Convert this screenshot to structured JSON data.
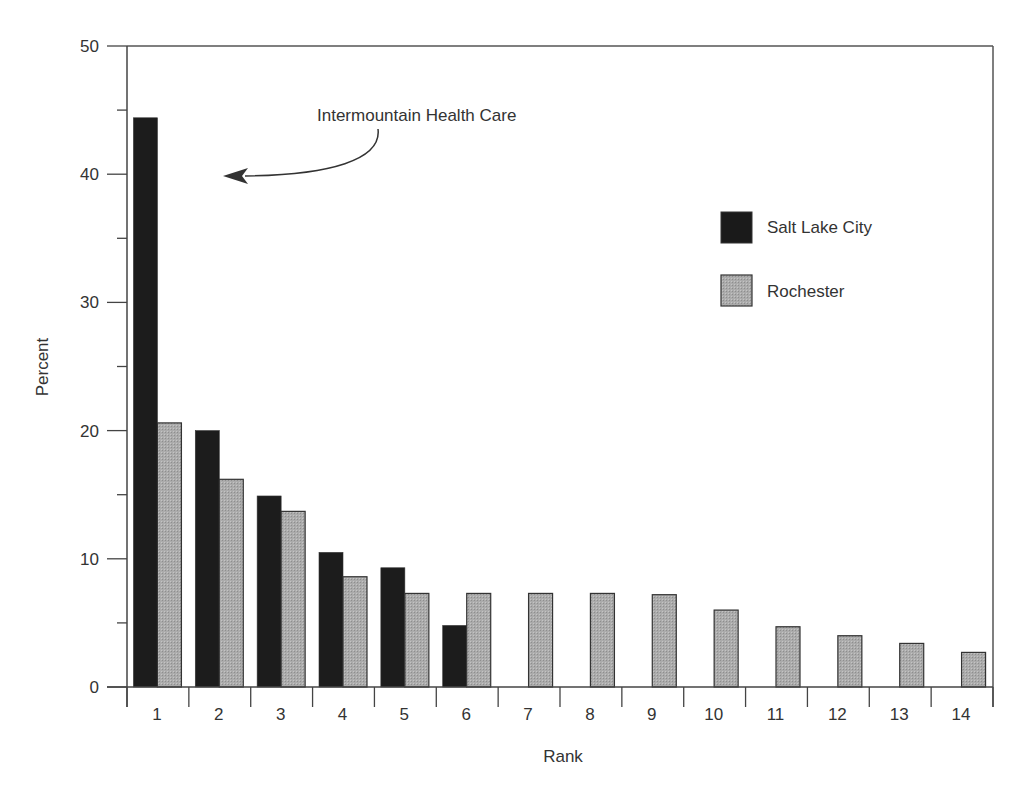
{
  "chart_data": {
    "type": "bar",
    "title": "",
    "xlabel": "Rank",
    "ylabel": "Percent",
    "ylim": [
      0,
      50
    ],
    "yticks": [
      0,
      10,
      20,
      30,
      40,
      50
    ],
    "grid": false,
    "legend_position": "upper right (inside plot)",
    "categories": [
      "1",
      "2",
      "3",
      "4",
      "5",
      "6",
      "7",
      "8",
      "9",
      "10",
      "11",
      "12",
      "13",
      "14"
    ],
    "series": [
      {
        "name": "Salt Lake City",
        "color": "#1a1a1a",
        "values": [
          44.4,
          20.0,
          14.9,
          10.5,
          9.3,
          4.8,
          null,
          null,
          null,
          null,
          null,
          null,
          null,
          null
        ]
      },
      {
        "name": "Rochester",
        "color": "#a8a8a8",
        "values": [
          20.6,
          16.2,
          13.7,
          8.6,
          7.3,
          7.3,
          7.3,
          7.3,
          7.2,
          6.0,
          4.7,
          4.0,
          3.4,
          2.7
        ]
      }
    ],
    "annotations": [
      {
        "text": "Intermountain Health Care",
        "points_to": {
          "category": "1",
          "series": "Salt Lake City"
        }
      }
    ]
  },
  "legend": {
    "items": [
      {
        "label": "Salt Lake City",
        "color": "#1a1a1a"
      },
      {
        "label": "Rochester",
        "color": "#a8a8a8"
      }
    ]
  },
  "annotation": {
    "text": "Intermountain Health Care"
  }
}
